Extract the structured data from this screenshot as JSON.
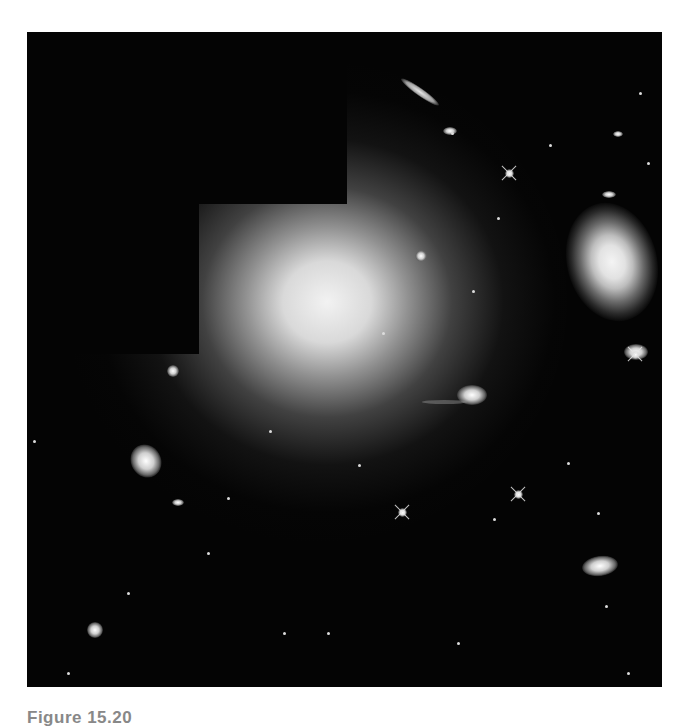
{
  "figure": {
    "background_color": "#040404",
    "mask_color": "#040404",
    "objects": {
      "giant_elliptical": "giant-elliptical-galaxy",
      "spiral": "spiral-galaxy",
      "edge_on": "edge-on-galaxy",
      "interacting": "interacting-galaxies",
      "elliptical_small": "small-elliptical-galaxy",
      "lower_right": "disk-galaxy"
    }
  },
  "caption": {
    "label": "Figure 15.20",
    "text": ""
  }
}
